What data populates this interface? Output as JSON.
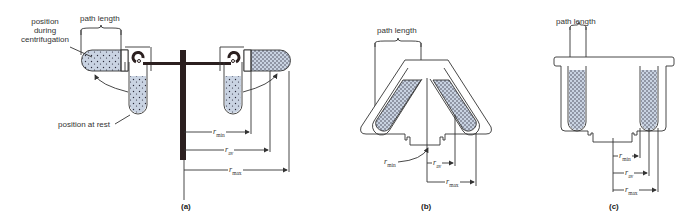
{
  "figure": {
    "panels": [
      {
        "id": "a",
        "caption": "(a)",
        "type": "swing-out rotor",
        "labels": {
          "path_length": "path length",
          "position_during": "position during centrifugation",
          "position_during_lines": [
            "position",
            "during",
            "centrifugation"
          ],
          "position_at_rest": "position at rest"
        },
        "radii": {
          "r": "r",
          "min": "min",
          "av": "av",
          "max": "max"
        }
      },
      {
        "id": "b",
        "caption": "(b)",
        "type": "fixed-angle rotor",
        "labels": {
          "path_length": "path length"
        },
        "radii": {
          "r": "r",
          "min": "min",
          "av": "av",
          "max": "max"
        }
      },
      {
        "id": "c",
        "caption": "(c)",
        "type": "vertical tube rotor",
        "labels": {
          "path_length": "path length"
        },
        "radii": {
          "r": "r",
          "min": "min",
          "av": "av",
          "max": "max"
        }
      }
    ],
    "colors": {
      "line": "#333333",
      "fill": "#c9d3e2",
      "dots": "#2a2a3a",
      "rotor": "#2b1f1f"
    }
  }
}
